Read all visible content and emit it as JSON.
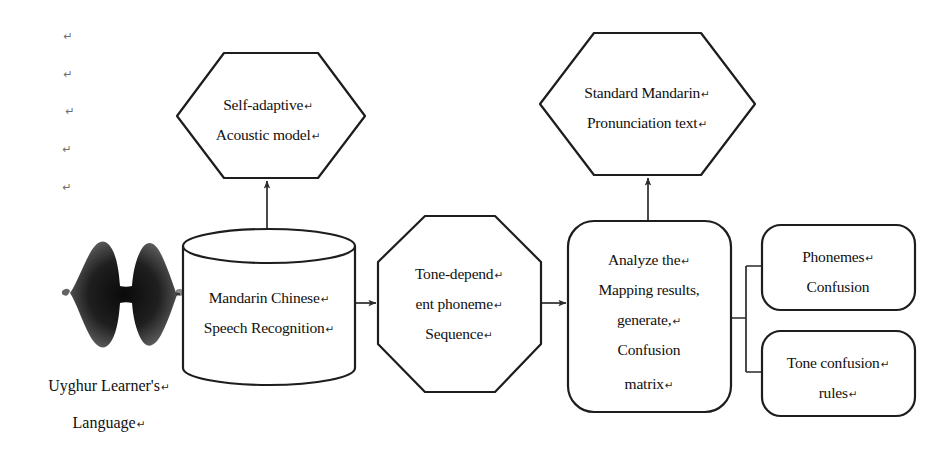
{
  "diagram": {
    "colors": {
      "stroke": "#1d1d1d",
      "connector": "#2b2b2b",
      "fill": "#ffffff",
      "text": "#101010",
      "margin_mark": "#6e6e6e"
    },
    "nodes": {
      "acoustic_model": {
        "shape": "hexagon",
        "line1": "Self-adaptive",
        "line2": "Acoustic model",
        "ret1": "↵",
        "ret2": "↵"
      },
      "pronunciation_text": {
        "shape": "hexagon",
        "line1": "Standard Mandarin",
        "line2": "Pronunciation text",
        "ret1": "↵",
        "ret2": "↵"
      },
      "speech_recognition": {
        "shape": "cylinder",
        "line1": "Mandarin Chinese",
        "line2": "Speech Recognition",
        "ret1": "↵",
        "ret2": "↵"
      },
      "phoneme_sequence": {
        "shape": "octagon",
        "line1": "Tone-depend",
        "line2": "ent phoneme",
        "line3": "Sequence",
        "ret1": "↵",
        "ret2": "↵",
        "ret3": "↵"
      },
      "confusion_matrix": {
        "shape": "rounded-rect",
        "line1": "Analyze the",
        "line2": "Mapping results,",
        "line3": "generate,",
        "line4": "Confusion",
        "line5": "matrix",
        "ret1": "↵",
        "ret3": "↵",
        "ret5": "↵"
      },
      "phonemes_confusion": {
        "shape": "rounded-rect",
        "line1": "Phonemes",
        "line2": "Confusion",
        "ret1": "↵"
      },
      "tone_confusion_rules": {
        "shape": "rounded-rect",
        "line1": "Tone confusion",
        "line2": "rules",
        "ret1": "↵",
        "ret2": "↵"
      },
      "waveform": {
        "shape": "audio-waveform",
        "label": "speech waveform"
      }
    },
    "caption": {
      "line1": "Uyghur Learner's",
      "line2": "Language",
      "ret1": "↵",
      "ret2": "↵"
    },
    "margin_marks": {
      "symbol": "↵",
      "count": 5
    }
  }
}
